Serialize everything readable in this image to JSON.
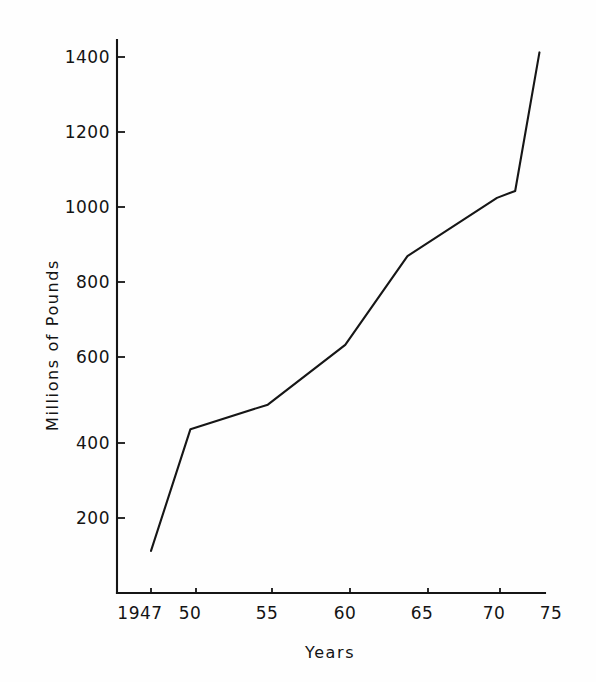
{
  "figure": {
    "background_color": "#fefefe",
    "ink_color": "#151515"
  },
  "chart_data": {
    "type": "line",
    "title": "",
    "subtitle": "",
    "xlabel": "Years",
    "ylabel": "Millions of Pounds",
    "xlim": [
      1947,
      1975
    ],
    "ylim": [
      0,
      1460
    ],
    "grid": false,
    "legend": false,
    "legend_position": "none",
    "x_tick_labels": [
      "1947",
      "50",
      "55",
      "60",
      "65",
      "70",
      "75"
    ],
    "x_tick_values": [
      1947,
      1950,
      1955,
      1960,
      1965,
      1970,
      1975
    ],
    "y_tick_labels": [
      "200",
      "400",
      "600",
      "800",
      "1000",
      "1200",
      "1400"
    ],
    "y_tick_values": [
      200,
      400,
      600,
      800,
      1000,
      1200,
      1400
    ],
    "series": [
      {
        "name": "Millions of Pounds",
        "color": "#161616",
        "x": [
          1947,
          1949.6,
          1954.7,
          1959.8,
          1963.9,
          1969.8,
          1971.0,
          1972.6
        ],
        "values": [
          110,
          428,
          492,
          648,
          880,
          1032,
          1050,
          1412
        ]
      }
    ]
  }
}
